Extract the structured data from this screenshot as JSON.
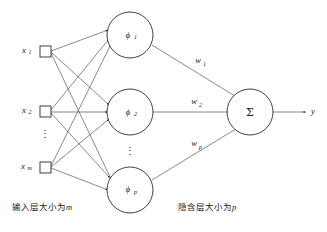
{
  "figure": {
    "type": "neural-network-diagram",
    "background_color": "#ffffff",
    "stroke_color": "#2b2b2b"
  },
  "input_layer": {
    "node_shape": "square",
    "nodes": [
      {
        "label": "x",
        "subscript": "1"
      },
      {
        "label": "x",
        "subscript": "2"
      },
      {
        "label": "x",
        "subscript": "m"
      }
    ],
    "ellipsis": "⋮",
    "caption_text": "输入层大小为",
    "caption_var": "m"
  },
  "hidden_layer": {
    "node_shape": "circle",
    "nodes": [
      {
        "label": "ϕ",
        "subscript": "1"
      },
      {
        "label": "ϕ",
        "subscript": "2"
      },
      {
        "label": "ϕ",
        "subscript": "p"
      }
    ],
    "ellipsis": "⋮",
    "caption_text": "隐含层大小为",
    "caption_var": "p"
  },
  "weights": [
    {
      "label": "w",
      "subscript": "1"
    },
    {
      "label": "w",
      "subscript": "2"
    },
    {
      "label": "w",
      "subscript": "p"
    }
  ],
  "output_layer": {
    "node_shape": "circle",
    "node_label": "Σ",
    "output_label": "y"
  }
}
